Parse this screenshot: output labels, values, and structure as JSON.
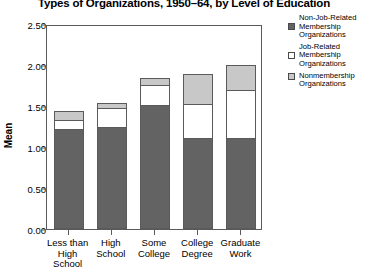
{
  "chart_data": {
    "type": "bar",
    "subtype": "stacked",
    "title": "Types of Organizations, 1950–64, by Level of Education",
    "xlabel": "",
    "ylabel": "Mean",
    "ylim": [
      0.0,
      2.5
    ],
    "yticks": [
      "0.00",
      "0.50",
      "1.00",
      "1.50",
      "2.00",
      "2.50"
    ],
    "ytick_values": [
      0.0,
      0.5,
      1.0,
      1.5,
      2.0,
      2.5
    ],
    "grid": false,
    "legend_position": "right",
    "categories": [
      "Less than High School",
      "High School",
      "Some College",
      "College Degree",
      "Graduate Work"
    ],
    "category_lines": [
      [
        "Less than",
        "High",
        "School"
      ],
      [
        "High",
        "School"
      ],
      [
        "Some",
        "College"
      ],
      [
        "College",
        "Degree"
      ],
      [
        "Graduate",
        "Work"
      ]
    ],
    "series": [
      {
        "name": "Nonmembership Organizations",
        "name_lines": [
          "Nonmembership",
          "Organizations"
        ],
        "color": "#636363",
        "values": [
          1.22,
          1.24,
          1.51,
          1.11,
          1.11
        ]
      },
      {
        "name": "Job-Related Membership Organizations",
        "name_lines": [
          "Job-Related",
          "Membership",
          "Organizations"
        ],
        "color": "#ffffff",
        "values": [
          0.12,
          0.25,
          0.26,
          0.43,
          0.6
        ]
      },
      {
        "name": "Non-Job-Related Membership Organizations",
        "name_lines": [
          "Non-Job-Related",
          "Membership",
          "Organizations"
        ],
        "color": "#c8c8c8",
        "values": [
          0.12,
          0.07,
          0.1,
          0.37,
          0.32
        ]
      }
    ],
    "totals": [
      1.46,
      1.56,
      1.87,
      1.91,
      2.03
    ],
    "stack_order_bottom_to_top": [
      "Nonmembership Organizations",
      "Job-Related Membership Organizations",
      "Non-Job-Related Membership Organizations"
    ]
  },
  "legend": {
    "entries": [
      {
        "swatch_color": "#636363",
        "lines": [
          "Non-Job-Related",
          "Membership",
          "Organizations"
        ]
      },
      {
        "swatch_color": "#ffffff",
        "lines": [
          "Job-Related",
          "Membership",
          "Organizations"
        ]
      },
      {
        "swatch_color": "#c8c8c8",
        "lines": [
          "Nonmembership",
          "Organizations"
        ]
      }
    ]
  },
  "axis_colors": {
    "frame": "#5a5a5a",
    "text": "#000000",
    "background": "#ffffff"
  }
}
